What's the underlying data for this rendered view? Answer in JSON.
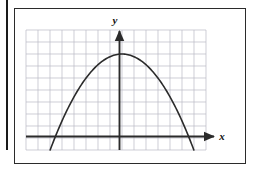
{
  "figure": {
    "frame_color": "#2b2b2b",
    "background_color": "#ffffff",
    "binding_edge_color": "#1a1a1a"
  },
  "axes": {
    "x_label": "x",
    "y_label": "y",
    "axis_color": "#2b2b2b",
    "grid_color": "#b9b9c4",
    "x_axis_has_arrow": true,
    "y_axis_has_arrow": true
  },
  "chart_data": {
    "type": "line",
    "title": "",
    "subtitle": "",
    "xlabel": "x",
    "ylabel": "y",
    "grid": true,
    "legend": "none",
    "grid_columns": 15,
    "grid_rows": 10,
    "cell_size_units": 1,
    "xlim": [
      -8,
      7
    ],
    "ylim": [
      -1,
      9
    ],
    "curve_shape": "parabola-opening-downward",
    "vertex": [
      0,
      7
    ],
    "roots": [
      -5.4,
      5.6
    ],
    "series": [
      {
        "name": "parabola",
        "equation": "y = 7 - 0.24 x^2",
        "x": [
          -5.4,
          -4.5,
          -3.5,
          -2.5,
          -1.5,
          -0.5,
          0,
          0.5,
          1.5,
          2.5,
          3.5,
          4.5,
          5.6
        ],
        "y": [
          0,
          2.14,
          4.06,
          5.5,
          6.46,
          6.94,
          7,
          6.94,
          6.46,
          5.5,
          4.06,
          2.14,
          0
        ]
      }
    ]
  }
}
